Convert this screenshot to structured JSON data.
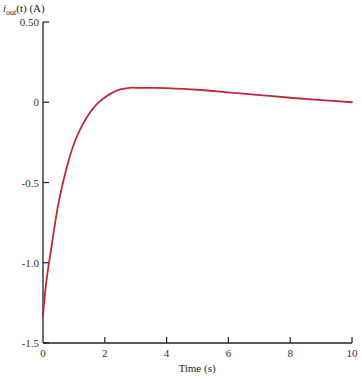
{
  "chart_data": {
    "type": "line",
    "title": "",
    "ylabel": "i_out(t) (A)",
    "ylabel_main": "i",
    "ylabel_sub": "out",
    "ylabel_rest": "(t) (A)",
    "xlabel": "Time (s)",
    "xlim": [
      0,
      10
    ],
    "ylim": [
      -1.5,
      0.5
    ],
    "xticks": [
      0,
      2,
      4,
      6,
      8,
      10
    ],
    "xtick_labels": [
      "0",
      "2",
      "4",
      "6",
      "8",
      "10"
    ],
    "yticks": [
      0.5,
      0,
      -0.5,
      -1.0,
      -1.5
    ],
    "ytick_labels": [
      "0.50",
      "0",
      "-0.5",
      "-1.0",
      "-1.5"
    ],
    "grid": false,
    "legend": null,
    "series": [
      {
        "name": "i_out(t)",
        "color": "#c0283c",
        "x": [
          0,
          0.1,
          0.25,
          0.5,
          0.75,
          1.0,
          1.25,
          1.5,
          1.75,
          2.0,
          2.25,
          2.5,
          2.8,
          3.0,
          3.5,
          4.0,
          5.0,
          6.0,
          7.0,
          8.0,
          9.0,
          10.0
        ],
        "values": [
          -1.33,
          -1.13,
          -0.93,
          -0.63,
          -0.42,
          -0.26,
          -0.15,
          -0.07,
          -0.01,
          0.03,
          0.06,
          0.08,
          0.09,
          0.09,
          0.09,
          0.088,
          0.078,
          0.062,
          0.045,
          0.028,
          0.013,
          0.0
        ]
      }
    ]
  },
  "colors": {
    "axis": "#222222",
    "curve": "#c0283c"
  }
}
